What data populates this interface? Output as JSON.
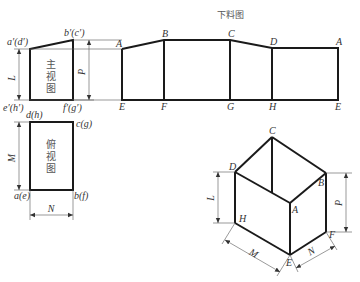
{
  "development": {
    "title": "下料图",
    "top_labels": [
      "A",
      "B",
      "C",
      "D",
      "A"
    ],
    "bottom_labels": [
      "E",
      "F",
      "G",
      "H",
      "E"
    ]
  },
  "front_view": {
    "name_chars": [
      "主",
      "视",
      "图"
    ],
    "corner_labels": {
      "top_left": "a′(d′)",
      "top_right": "b′(c′)",
      "bottom_left": "e′(h′)",
      "bottom_right": "f′(g′)"
    },
    "dimensions": {
      "left": "L",
      "right": "P"
    }
  },
  "top_view": {
    "name_chars": [
      "俯",
      "视",
      "图"
    ],
    "corner_labels": {
      "top_left": "d(h)",
      "top_right": "c(g)",
      "bottom_left": "a(e)",
      "bottom_right": "b(f)"
    },
    "dimensions": {
      "left": "M",
      "bottom": "N"
    }
  },
  "isometric": {
    "vertex_labels": {
      "C": "C",
      "D": "D",
      "B": "B",
      "A": "A",
      "H": "H",
      "E": "E",
      "F": "F"
    },
    "dimensions": {
      "L": "L",
      "P": "P",
      "M": "M",
      "N": "N"
    }
  }
}
